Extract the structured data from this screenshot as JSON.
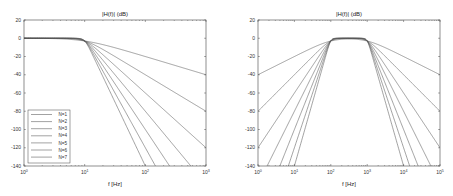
{
  "chart_data": [
    {
      "type": "line",
      "title": "|H(f)| (dB)",
      "xlabel": "f [Hz]",
      "ylabel": "",
      "xscale": "log",
      "xlim": [
        1,
        1000
      ],
      "ylim": [
        -140,
        20
      ],
      "xticks": [
        "10^0",
        "10^1",
        "10^2",
        "10^3"
      ],
      "yticks": [
        20,
        0,
        -20,
        -40,
        -60,
        -80,
        -100,
        -120,
        -140
      ],
      "grid": false,
      "legend_position": "lower-left",
      "filter": "Butterworth low-pass",
      "cutoff_hz": 10,
      "series": [
        {
          "name": "N=1",
          "order": 1,
          "value_at_1000Hz_dB": -40
        },
        {
          "name": "N=2",
          "order": 2,
          "value_at_1000Hz_dB": -80
        },
        {
          "name": "N=3",
          "order": 3,
          "value_at_1000Hz_dB": -120
        },
        {
          "name": "N=4",
          "order": 4,
          "value_at_1000Hz_dB": -160
        },
        {
          "name": "N=5",
          "order": 5,
          "value_at_1000Hz_dB": -200
        },
        {
          "name": "N=6",
          "order": 6,
          "value_at_1000Hz_dB": -240
        },
        {
          "name": "N=7",
          "order": 7,
          "value_at_1000Hz_dB": -280
        }
      ]
    },
    {
      "type": "line",
      "title": "|H(f)| (dB)",
      "xlabel": "f [Hz]",
      "ylabel": "",
      "xscale": "log",
      "xlim": [
        1,
        100000
      ],
      "ylim": [
        -140,
        20
      ],
      "xticks": [
        "10^0",
        "10^1",
        "10^2",
        "10^3",
        "10^4",
        "10^5"
      ],
      "yticks": [
        20,
        0,
        -20,
        -40,
        -60,
        -80,
        -100,
        -120,
        -140
      ],
      "grid": false,
      "filter": "Butterworth band-pass",
      "low_cutoff_hz": 100,
      "high_cutoff_hz": 1000,
      "series": [
        {
          "name": "N=1",
          "order": 1,
          "value_at_1Hz_dB": -40,
          "value_at_100000Hz_dB": -40
        },
        {
          "name": "N=2",
          "order": 2,
          "value_at_1Hz_dB": -80,
          "value_at_100000Hz_dB": -80
        },
        {
          "name": "N=3",
          "order": 3,
          "value_at_1Hz_dB": -120,
          "value_at_100000Hz_dB": -120
        },
        {
          "name": "N=4",
          "order": 4
        },
        {
          "name": "N=5",
          "order": 5
        },
        {
          "name": "N=6",
          "order": 6
        },
        {
          "name": "N=7",
          "order": 7
        }
      ]
    }
  ],
  "plots": {
    "left": {
      "title": "|H(f)| (dB)",
      "xlabel": "f [Hz]",
      "yticks": [
        "20",
        "0",
        "-20",
        "-40",
        "-60",
        "-80",
        "-100",
        "-120",
        "-140"
      ],
      "xticks": [
        "0",
        "1",
        "2",
        "3"
      ],
      "legend": [
        "N=1",
        "N=2",
        "N=3",
        "N=4",
        "N=5",
        "N=6",
        "N=7"
      ]
    },
    "right": {
      "title": "|H(f)| (dB)",
      "xlabel": "f [Hz]",
      "yticks": [
        "20",
        "0",
        "-20",
        "-40",
        "-60",
        "-80",
        "-100",
        "-120",
        "-140"
      ],
      "xticks": [
        "0",
        "1",
        "2",
        "3",
        "4",
        "5"
      ]
    }
  },
  "colors": {
    "line": "#555555",
    "axis": "#444444",
    "legend_border": "#444444"
  }
}
